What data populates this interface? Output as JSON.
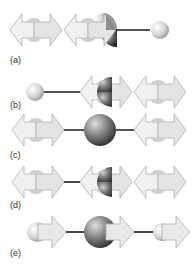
{
  "labels": {
    "a": "(a)",
    "b": "(b)",
    "c": "(c)",
    "d": "(d)",
    "e": "(e)"
  },
  "colors": {
    "arrow_fill": "#e9e9e9",
    "arrow_stroke": "#b5b5b5",
    "linker": "#1a1a1a",
    "small_sphere": "#d8d8d8",
    "large_sphere": "#8a8a8a",
    "dark_quadrant": "#3a3a3a"
  }
}
